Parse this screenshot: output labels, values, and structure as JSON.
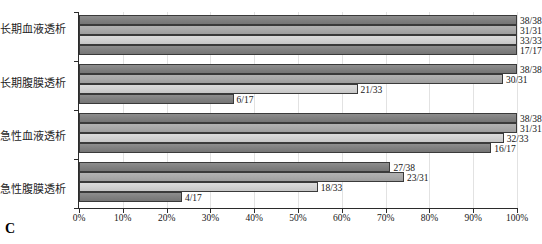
{
  "panel": {
    "letter": "C"
  },
  "chart_data": {
    "type": "bar",
    "orientation": "horizontal",
    "title": "",
    "xlabel": "",
    "ylabel": "",
    "xlim": [
      0,
      100
    ],
    "xtick_labels": [
      "0%",
      "10%",
      "20%",
      "30%",
      "40%",
      "50%",
      "60%",
      "70%",
      "80%",
      "90%",
      "100%"
    ],
    "xtick_values": [
      0,
      10,
      20,
      30,
      40,
      50,
      60,
      70,
      80,
      90,
      100
    ],
    "grid": true,
    "legend": "none",
    "categories": [
      "长期血液透析",
      "长期腹膜透析",
      "急性血液透析",
      "急性腹膜透析"
    ],
    "series": [
      {
        "name": "series-1",
        "color": "#808080",
        "values": [
          100.0,
          100.0,
          100.0,
          71.1
        ],
        "labels": [
          "38/38",
          "38/38",
          "38/38",
          "27/38"
        ]
      },
      {
        "name": "series-2",
        "color": "#a9a9a9",
        "values": [
          100.0,
          96.8,
          100.0,
          74.2
        ],
        "labels": [
          "31/31",
          "30/31",
          "31/31",
          "23/31"
        ]
      },
      {
        "name": "series-3",
        "color": "#d2d2d2",
        "values": [
          100.0,
          63.6,
          97.0,
          54.5
        ],
        "labels": [
          "33/33",
          "21/33",
          "32/33",
          "18/33"
        ]
      },
      {
        "name": "series-4",
        "color": "#808080",
        "values": [
          100.0,
          35.3,
          94.1,
          23.5
        ],
        "labels": [
          "17/17",
          "6/17",
          "16/17",
          "4/17"
        ]
      }
    ]
  }
}
